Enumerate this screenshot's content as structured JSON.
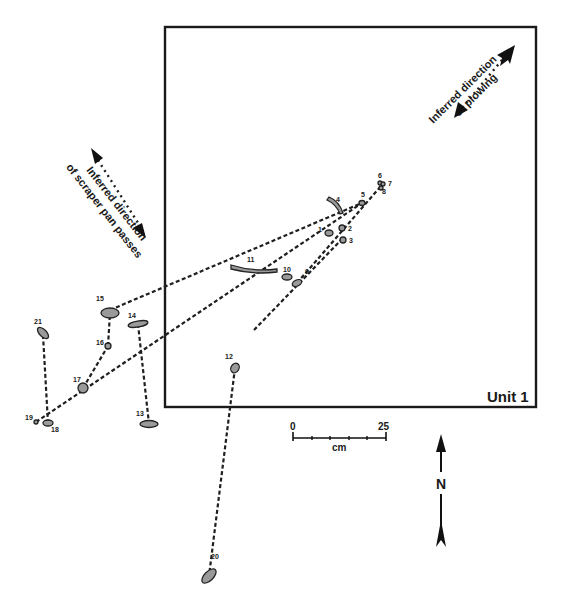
{
  "unit": {
    "label": "Unit 1",
    "box": [
      165,
      27,
      536,
      407
    ]
  },
  "annotations": {
    "plowing": {
      "line1": "Inferred direction",
      "line2": "of plowing"
    },
    "scraper": {
      "line1": "Inferred direction",
      "line2": "of scraper pan passes"
    }
  },
  "scale_bar": {
    "start": "0",
    "end": "25",
    "unit": "cm"
  },
  "north_arrow": {
    "label": "N"
  },
  "artifacts": [
    {
      "id": "1",
      "x": 329,
      "y": 233,
      "rx": 4,
      "ry": 3,
      "rot": 0,
      "lx": 318,
      "ly": 232
    },
    {
      "id": "2",
      "x": 342,
      "y": 228,
      "rx": 3,
      "ry": 3,
      "rot": 0,
      "lx": 348,
      "ly": 231
    },
    {
      "id": "3",
      "x": 343,
      "y": 240,
      "rx": 3,
      "ry": 3,
      "rot": 0,
      "lx": 349,
      "ly": 243
    },
    {
      "id": "4",
      "x": 331,
      "y": 205,
      "rx": 3,
      "ry": 3,
      "rot": 0,
      "lx": 336,
      "ly": 202
    },
    {
      "id": "5",
      "x": 362,
      "y": 203,
      "rx": 3,
      "ry": 2.5,
      "rot": 0,
      "lx": 361,
      "ly": 197
    },
    {
      "id": "6",
      "x": 380,
      "y": 183,
      "rx": 2,
      "ry": 2,
      "rot": 0,
      "lx": 378,
      "ly": 178
    },
    {
      "id": "7",
      "x": 383,
      "y": 184,
      "rx": 2,
      "ry": 2,
      "rot": 0,
      "lx": 388,
      "ly": 186
    },
    {
      "id": "8",
      "x": 381,
      "y": 188,
      "rx": 2,
      "ry": 2,
      "rot": 0,
      "lx": 382,
      "ly": 194
    },
    {
      "id": "9",
      "x": 297,
      "y": 283,
      "rx": 5,
      "ry": 3,
      "rot": -25,
      "lx": 305,
      "ly": 274
    },
    {
      "id": "10",
      "x": 287,
      "y": 277,
      "rx": 5,
      "ry": 3,
      "rot": 0,
      "lx": 283,
      "ly": 272
    },
    {
      "id": "11",
      "x": 253,
      "y": 267,
      "rx": 22,
      "ry": 2.5,
      "rot": 3,
      "lx": 247,
      "ly": 262
    },
    {
      "id": "12",
      "x": 235,
      "y": 368,
      "rx": 4,
      "ry": 5,
      "rot": 30,
      "lx": 225,
      "ly": 359
    },
    {
      "id": "13",
      "x": 149,
      "y": 424,
      "rx": 9,
      "ry": 3.5,
      "rot": 0,
      "lx": 136,
      "ly": 416
    },
    {
      "id": "14",
      "x": 138,
      "y": 324,
      "rx": 10,
      "ry": 3,
      "rot": -10,
      "lx": 128,
      "ly": 318
    },
    {
      "id": "15",
      "x": 110,
      "y": 313,
      "rx": 9,
      "ry": 5,
      "rot": 0,
      "lx": 96,
      "ly": 301
    },
    {
      "id": "16",
      "x": 108,
      "y": 346,
      "rx": 3,
      "ry": 3,
      "rot": 0,
      "lx": 96,
      "ly": 345
    },
    {
      "id": "17",
      "x": 83,
      "y": 388,
      "rx": 5,
      "ry": 5,
      "rot": 0,
      "lx": 73,
      "ly": 382
    },
    {
      "id": "18",
      "x": 48,
      "y": 423,
      "rx": 5,
      "ry": 3,
      "rot": 0,
      "lx": 51,
      "ly": 432
    },
    {
      "id": "19",
      "x": 36,
      "y": 422,
      "rx": 2,
      "ry": 2,
      "rot": 0,
      "lx": 25,
      "ly": 420
    },
    {
      "id": "20",
      "x": 209,
      "y": 576,
      "rx": 9,
      "ry": 4.5,
      "rot": -45,
      "lx": 211,
      "ly": 559
    },
    {
      "id": "21",
      "x": 43,
      "y": 333,
      "rx": 7,
      "ry": 3.5,
      "rot": 45,
      "lx": 34,
      "ly": 324
    }
  ],
  "refit_lines": [
    [
      [
        110,
        310
      ],
      [
        362,
        203
      ]
    ],
    [
      [
        36,
        422
      ],
      [
        362,
        203
      ]
    ],
    [
      [
        83,
        388
      ],
      [
        108,
        346
      ]
    ],
    [
      [
        108,
        346
      ],
      [
        110,
        313
      ]
    ],
    [
      [
        43,
        335
      ],
      [
        48,
        423
      ]
    ],
    [
      [
        138,
        324
      ],
      [
        149,
        424
      ]
    ],
    [
      [
        235,
        368
      ],
      [
        209,
        576
      ]
    ],
    [
      [
        254,
        330
      ],
      [
        343,
        238
      ]
    ],
    [
      [
        297,
        283
      ],
      [
        381,
        186
      ]
    ]
  ]
}
